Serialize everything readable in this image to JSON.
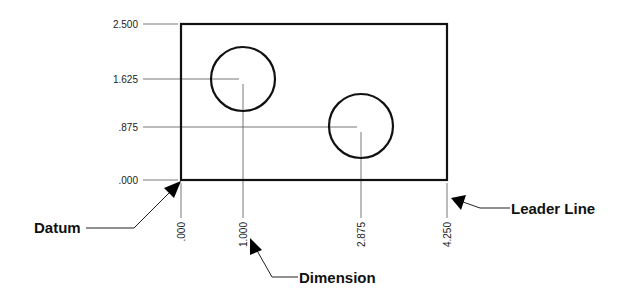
{
  "diagram": {
    "type": "baseline-dimensioning",
    "part": {
      "shape": "rectangle",
      "width": 4.25,
      "height": 2.5
    },
    "holes": [
      {
        "name": "hole-1",
        "x": 1.0,
        "y": 1.625
      },
      {
        "name": "hole-2",
        "x": 2.875,
        "y": 0.875
      }
    ],
    "y_dimensions": [
      {
        "label": "2.500",
        "value": 2.5
      },
      {
        "label": "1.625",
        "value": 1.625
      },
      {
        "label": ".875",
        "value": 0.875
      },
      {
        "label": ".000",
        "value": 0.0
      }
    ],
    "x_dimensions": [
      {
        "label": ".000",
        "value": 0.0
      },
      {
        "label": "1.000",
        "value": 1.0
      },
      {
        "label": "2.875",
        "value": 2.875
      },
      {
        "label": "4.250",
        "value": 4.25
      }
    ],
    "callouts": {
      "datum": "Datum",
      "dimension": "Dimension",
      "leader_line": "Leader Line"
    },
    "colors": {
      "background": "#ffffff",
      "outline": "#111111",
      "extension_line": "#555555",
      "text": "#222222"
    }
  }
}
